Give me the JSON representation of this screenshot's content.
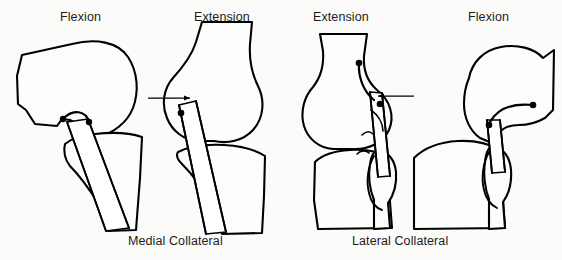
{
  "figure": {
    "background_color": "#fbfbfa",
    "ink_color": "#000000",
    "width": 562,
    "height": 260
  },
  "panel_labels": [
    {
      "id": "panel-1-label",
      "text": "Flexion",
      "x": 60,
      "y": 10
    },
    {
      "id": "panel-2-label",
      "text": "Extension",
      "x": 194,
      "y": 10
    },
    {
      "id": "panel-3-label",
      "text": "Extension",
      "x": 313,
      "y": 10
    },
    {
      "id": "panel-4-label",
      "text": "Flexion",
      "x": 468,
      "y": 10
    }
  ],
  "captions": [
    {
      "id": "caption-medial",
      "text": "Medial Collateral",
      "x": 128,
      "y": 234
    },
    {
      "id": "caption-lateral",
      "text": "Lateral Collateral",
      "x": 352,
      "y": 234
    }
  ],
  "panels": [
    {
      "id": "panel-medial-flexion",
      "label": "Flexion",
      "group": "Medial Collateral",
      "ligament": "medial collateral ligament",
      "state": "flexion",
      "has_leader_line": false,
      "attachment_markers": 2
    },
    {
      "id": "panel-medial-extension",
      "label": "Extension",
      "group": "Medial Collateral",
      "ligament": "medial collateral ligament",
      "state": "extension",
      "has_leader_line": true,
      "attachment_markers": 1
    },
    {
      "id": "panel-lateral-extension",
      "label": "Extension",
      "group": "Lateral Collateral",
      "ligament": "lateral collateral ligament",
      "state": "extension",
      "has_leader_line": true,
      "attachment_markers": 2
    },
    {
      "id": "panel-lateral-flexion",
      "label": "Flexion",
      "group": "Lateral Collateral",
      "ligament": "lateral collateral ligament",
      "state": "flexion",
      "has_leader_line": false,
      "attachment_markers": 2
    }
  ]
}
